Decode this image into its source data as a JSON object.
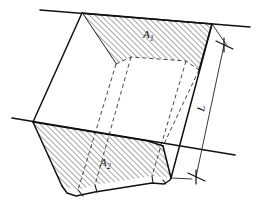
{
  "figure": {
    "type": "engineering-pictorial-diagram",
    "background_color": "#ffffff",
    "line_color": "#111111",
    "hidden_line_color": "#333333",
    "hatch_color": "#222222"
  },
  "labels": {
    "area_near": {
      "base": "A",
      "subscript": "1",
      "full": "A1",
      "meaning": "cross-sectional end area at near face"
    },
    "area_far": {
      "base": "A",
      "subscript": "2",
      "full": "A2",
      "meaning": "cross-sectional end area at far face"
    },
    "length": {
      "base": "L",
      "subscript": "",
      "full": "L",
      "meaning": "distance between the two end areas"
    }
  },
  "annotations": {
    "dimension_style": "slash-tick arrowheads at both ends",
    "hatch_angle_degrees": 45,
    "hatch_spacing_px": 4,
    "hidden_line_style": "dashed",
    "ground_line_count": 2
  },
  "geometry": {
    "ground_line_upper": "from (40,10) to (250,27)",
    "ground_line_lower": "from (12,118) to (235,155)",
    "end_area_near_label_pos": "x=143,y=35",
    "end_area_far_label_pos": "x=100,y=165",
    "length_label_pos": "x=204,y=108"
  }
}
